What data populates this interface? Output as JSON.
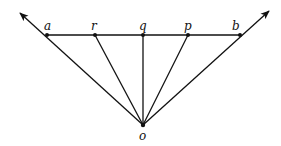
{
  "diagram": {
    "colors": {
      "line": "#111111",
      "background": "#ffffff"
    },
    "points": {
      "o": {
        "label": "o",
        "x": 143,
        "y": 125
      },
      "a": {
        "label": "a",
        "x": 47,
        "y": 35
      },
      "r": {
        "label": "r",
        "x": 95,
        "y": 35
      },
      "q": {
        "label": "q",
        "x": 143,
        "y": 35
      },
      "p": {
        "label": "p",
        "x": 188,
        "y": 35
      },
      "b": {
        "label": "b",
        "x": 240,
        "y": 35
      }
    },
    "labels": {
      "a": "a",
      "r": "r",
      "q": "q",
      "p": "p",
      "b": "b",
      "o": "o"
    },
    "segments": [
      "a-b",
      "o-a",
      "o-r",
      "o-q",
      "o-p",
      "o-b"
    ],
    "arrows": [
      "ray o→a extended",
      "ray o→b extended"
    ]
  }
}
